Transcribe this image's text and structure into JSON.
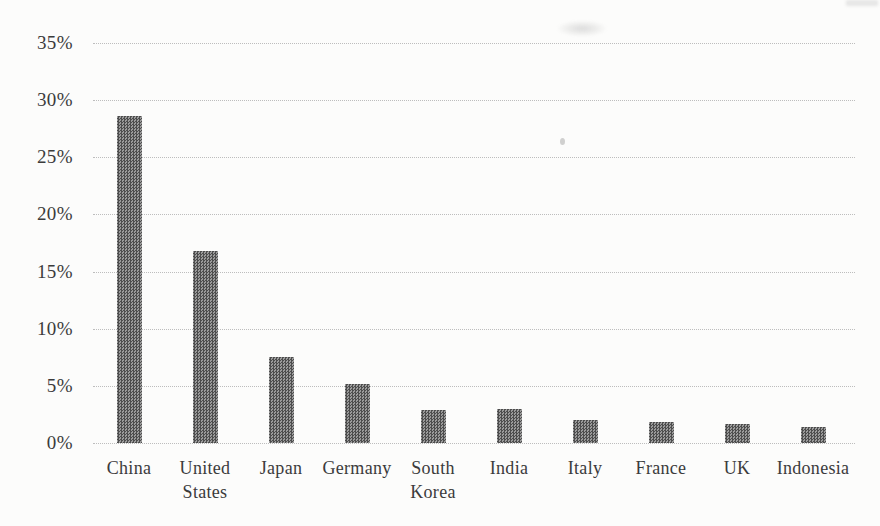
{
  "chart_data": {
    "type": "bar",
    "title": "",
    "xlabel": "",
    "ylabel": "",
    "categories": [
      "China",
      "United States",
      "Japan",
      "Germany",
      "South Korea",
      "India",
      "Italy",
      "France",
      "UK",
      "Indonesia"
    ],
    "values": [
      28.6,
      16.8,
      7.5,
      5.2,
      2.9,
      3.0,
      2.0,
      1.8,
      1.7,
      1.4
    ],
    "label_lines": [
      [
        "China"
      ],
      [
        "United",
        "States"
      ],
      [
        "Japan"
      ],
      [
        "Germany"
      ],
      [
        "South",
        "Korea"
      ],
      [
        "India"
      ],
      [
        "Italy"
      ],
      [
        "France"
      ],
      [
        "UK"
      ],
      [
        "Indonesia"
      ]
    ],
    "ylim": [
      0,
      35
    ],
    "ytick_interval": 5,
    "yticks": [
      {
        "value": 0,
        "label": "0%"
      },
      {
        "value": 5,
        "label": "5%"
      },
      {
        "value": 10,
        "label": "10%"
      },
      {
        "value": 15,
        "label": "15%"
      },
      {
        "value": 20,
        "label": "20%"
      },
      {
        "value": 25,
        "label": "25%"
      },
      {
        "value": 30,
        "label": "30%"
      },
      {
        "value": 35,
        "label": "35%"
      }
    ],
    "grid": "horizontal-dotted",
    "legend": "none",
    "bar_fill": "checkerboard-pattern",
    "colors": {
      "bar_dark": "#4d4d4d",
      "bar_light": "#9b9b9b",
      "gridline": "#bdbdbd",
      "label": "#3b3b3b",
      "background": "#fcfcfb"
    }
  }
}
